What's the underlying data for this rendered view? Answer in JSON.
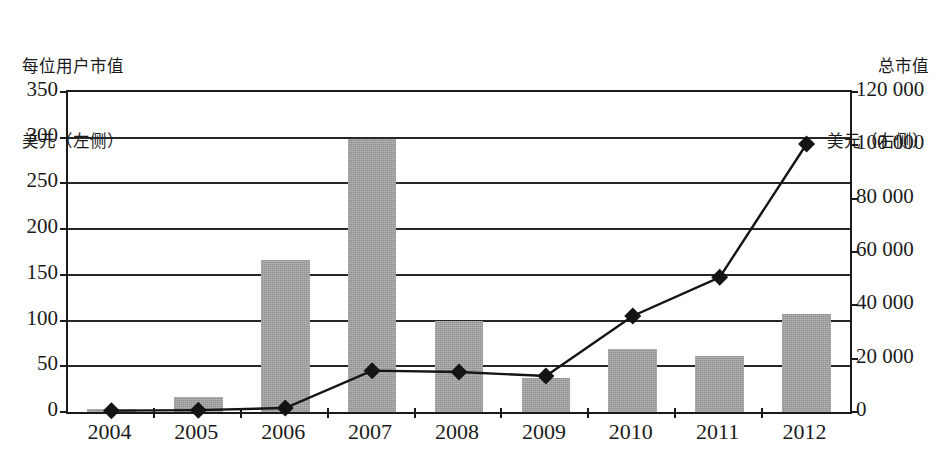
{
  "chart_data": {
    "type": "bar",
    "title": "",
    "subtitle": "",
    "categories": [
      "2004",
      "2005",
      "2006",
      "2007",
      "2008",
      "2009",
      "2010",
      "2011",
      "2012"
    ],
    "xlabel": "",
    "grid": true,
    "legend": "none",
    "axes": {
      "left": {
        "label_lines": [
          "每位用户市值",
          "美元（左侧）"
        ],
        "label": "每位用户市值 美元（左侧）",
        "ylim": [
          0,
          350
        ],
        "ticks": [
          0,
          50,
          100,
          150,
          200,
          250,
          300,
          350
        ],
        "tick_labels": [
          "0",
          "50",
          "100",
          "150",
          "200",
          "250",
          "300",
          "350"
        ]
      },
      "right": {
        "label_lines": [
          "总市值",
          "美元（右侧）"
        ],
        "label": "总市值 美元（右侧）",
        "ylim": [
          0,
          120000
        ],
        "ticks": [
          0,
          20000,
          40000,
          60000,
          80000,
          100000,
          120000
        ],
        "tick_labels": [
          "0",
          "20 000",
          "40 000",
          "60 000",
          "80 000",
          "100 000",
          "120 000"
        ]
      }
    },
    "series": [
      {
        "name": "每位用户市值 美元（左侧）",
        "type": "bar",
        "axis": "left",
        "color": "#9e9e9e",
        "values": [
          3,
          16,
          166,
          299,
          100,
          37,
          69,
          61,
          107
        ]
      },
      {
        "name": "总市值 美元（右侧）",
        "type": "line",
        "axis": "right",
        "color": "#141414",
        "marker": "diamond",
        "values": [
          500,
          700,
          1500,
          15500,
          15000,
          13500,
          36000,
          50500,
          100500
        ]
      }
    ]
  }
}
